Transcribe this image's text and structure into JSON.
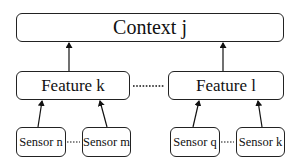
{
  "diagram": {
    "context": {
      "label": "Context j"
    },
    "features": [
      {
        "label": "Feature k"
      },
      {
        "label": "Feature l"
      }
    ],
    "sensors": [
      {
        "label": "Sensor n",
        "feature": "Feature k"
      },
      {
        "label": "Sensor m",
        "feature": "Feature k"
      },
      {
        "label": "Sensor q",
        "feature": "Feature l"
      },
      {
        "label": "Sensor k",
        "feature": "Feature l"
      }
    ],
    "edges": [
      {
        "from": "Feature k",
        "to": "Context j"
      },
      {
        "from": "Feature l",
        "to": "Context j"
      },
      {
        "from": "Sensor n",
        "to": "Feature k"
      },
      {
        "from": "Sensor m",
        "to": "Feature k"
      },
      {
        "from": "Sensor q",
        "to": "Feature l"
      },
      {
        "from": "Sensor k",
        "to": "Feature l"
      }
    ],
    "ellipsis_links": [
      {
        "between": [
          "Feature k",
          "Feature l"
        ]
      },
      {
        "between": [
          "Sensor n",
          "Sensor m"
        ]
      },
      {
        "between": [
          "Sensor q",
          "Sensor k"
        ]
      }
    ]
  }
}
